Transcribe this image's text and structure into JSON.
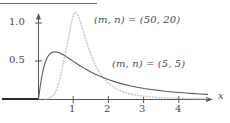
{
  "figure": {
    "top_rule": true,
    "background": "#ffffff",
    "axis_color": "#555555",
    "solid_curve_color": "#5a5a5a",
    "dotted_curve_color": "#c8c8c8",
    "zero_segment_color": "#2b2b2b"
  },
  "axes": {
    "x_name": "x",
    "x_ticks": [
      {
        "value": 1,
        "label": "1"
      },
      {
        "value": 2,
        "label": "2"
      },
      {
        "value": 3,
        "label": "3"
      },
      {
        "value": 4,
        "label": "4"
      }
    ],
    "y_ticks": [
      {
        "value": 1.0,
        "label": "1.0"
      },
      {
        "value": 0.5,
        "label": "0.5"
      }
    ],
    "xlim": [
      -1.1,
      4.95
    ],
    "ylim": [
      0,
      1.25
    ],
    "grid": false
  },
  "annotations": {
    "series_a": "(m, n) = (50, 20)",
    "series_b": "(m, n) = (5, 5)"
  },
  "chart_data": {
    "type": "line",
    "title": "",
    "xlabel": "x",
    "ylabel": "",
    "xlim": [
      -1.1,
      4.95
    ],
    "ylim": [
      0,
      1.25
    ],
    "grid": false,
    "legend_position": "inline-annotation",
    "series": [
      {
        "name": "(m, n) = (5, 5)",
        "style": "solid",
        "color": "#5a5a5a",
        "peak": {
          "x": 0.45,
          "y": 0.62
        },
        "x": [
          0.0,
          0.05,
          0.1,
          0.15,
          0.2,
          0.25,
          0.3,
          0.35,
          0.4,
          0.45,
          0.5,
          0.55,
          0.6,
          0.7,
          0.8,
          0.9,
          1.0,
          1.1,
          1.2,
          1.3,
          1.4,
          1.5,
          1.6,
          1.8,
          2.0,
          2.2,
          2.4,
          2.6,
          2.8,
          3.0,
          3.2,
          3.4,
          3.6,
          3.8,
          4.0,
          4.2,
          4.4,
          4.6,
          4.8
        ],
        "y": [
          0.0,
          0.171,
          0.312,
          0.418,
          0.494,
          0.547,
          0.582,
          0.604,
          0.616,
          0.62,
          0.619,
          0.614,
          0.606,
          0.583,
          0.554,
          0.523,
          0.492,
          0.461,
          0.431,
          0.403,
          0.377,
          0.352,
          0.329,
          0.288,
          0.252,
          0.222,
          0.196,
          0.174,
          0.155,
          0.139,
          0.125,
          0.113,
          0.102,
          0.093,
          0.085,
          0.078,
          0.071,
          0.066,
          0.061
        ]
      },
      {
        "name": "(m, n) = (50, 20)",
        "style": "dotted",
        "color": "#c8c8c8",
        "peak": {
          "x": 0.98,
          "y": 1.15
        },
        "x": [
          0.2,
          0.3,
          0.4,
          0.45,
          0.5,
          0.55,
          0.6,
          0.65,
          0.7,
          0.75,
          0.8,
          0.85,
          0.9,
          0.95,
          1.0,
          1.05,
          1.1,
          1.15,
          1.2,
          1.25,
          1.3,
          1.4,
          1.5,
          1.6,
          1.7,
          1.8,
          1.9,
          2.0,
          2.2,
          2.4,
          2.6,
          2.8,
          3.0,
          3.3,
          3.6,
          4.0,
          4.4,
          4.8
        ],
        "y": [
          0.0,
          0.006,
          0.035,
          0.065,
          0.11,
          0.175,
          0.258,
          0.357,
          0.466,
          0.58,
          0.691,
          0.794,
          0.926,
          1.04,
          1.12,
          1.142,
          1.12,
          1.068,
          1.0,
          0.925,
          0.848,
          0.7,
          0.57,
          0.462,
          0.374,
          0.303,
          0.246,
          0.201,
          0.136,
          0.094,
          0.067,
          0.049,
          0.036,
          0.023,
          0.015,
          0.009,
          0.005,
          0.003
        ]
      }
    ]
  }
}
